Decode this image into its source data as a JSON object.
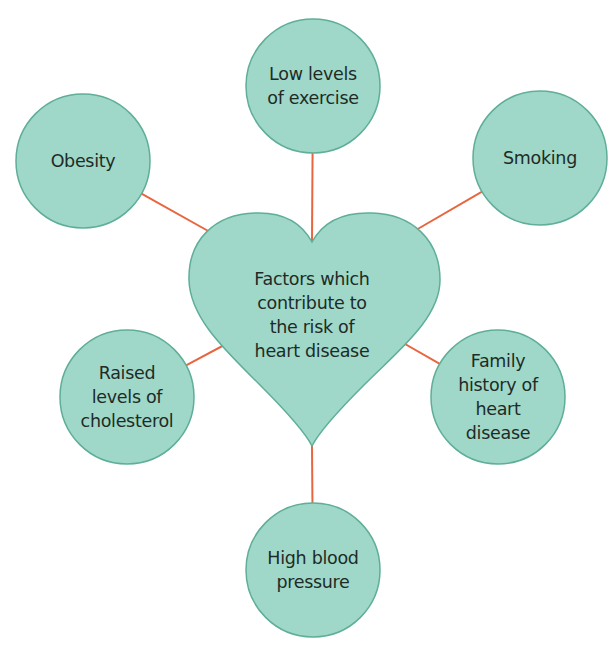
{
  "diagram": {
    "title": "Factors which contribute to the risk of heart disease",
    "colors": {
      "node_fill": "#9fd8c8",
      "node_stroke": "#5fae98",
      "connector": "#e8663e",
      "text": "#1e2b27"
    },
    "center": {
      "shape": "heart",
      "label": "Factors which\ncontribute to\nthe risk of\nheart disease"
    },
    "factors": [
      {
        "id": "exercise",
        "label": "Low levels\nof exercise"
      },
      {
        "id": "obesity",
        "label": "Obesity"
      },
      {
        "id": "smoking",
        "label": "Smoking"
      },
      {
        "id": "cholesterol",
        "label": "Raised\nlevels of\ncholesterol"
      },
      {
        "id": "family-history",
        "label": "Family\nhistory of\nheart\ndisease"
      },
      {
        "id": "blood-pressure",
        "label": "High blood\npressure"
      }
    ]
  }
}
